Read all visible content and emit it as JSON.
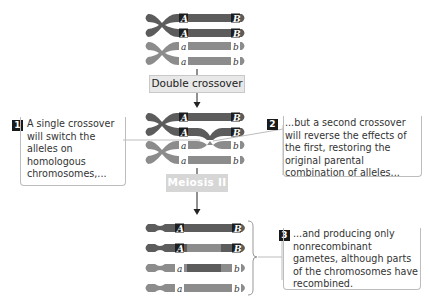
{
  "steps": {
    "double_crossover_label": "Double crossover",
    "meiosis_label": "Meiosis II"
  },
  "alleles": {
    "dominant_A": "A",
    "dominant_B": "B",
    "recessive_a": "a",
    "recessive_b": "b"
  },
  "callouts": [
    {
      "number": "1",
      "text": "A single crossover will switch the alleles on homologous chromosomes,..."
    },
    {
      "number": "2",
      "text": "...but a second crossover will reverse the effects of the first, restoring the original parental combination of alleles..."
    },
    {
      "number": "3",
      "text": "...and producing only nonrecombinant gametes, although parts of the chromosomes have recombined."
    }
  ],
  "colors": {
    "dark_chromatid": "#5a5a5a",
    "light_chromatid": "#8a8a8a",
    "label_box": "#e8e8e8",
    "faded_box": "#d6d6d6",
    "number_badge": "#1a1a1a"
  }
}
